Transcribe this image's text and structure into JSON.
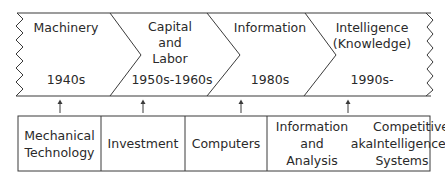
{
  "eras": [
    {
      "name": "Machinery",
      "period": "1940s"
    },
    {
      "name_lines": [
        "Capital",
        "and",
        "Labor"
      ],
      "period": "1950s-1960s"
    },
    {
      "name": "Information",
      "period": "1980s"
    },
    {
      "name_lines": [
        "Intelligence",
        "(Knowledge)"
      ],
      "period": "1990s-"
    }
  ],
  "drivers": [
    {
      "lines": [
        "Mechanical",
        "Technology"
      ]
    },
    {
      "lines": [
        "Investment"
      ]
    },
    {
      "lines": [
        "Computers"
      ]
    },
    {
      "left_lines": [
        "Information",
        "and",
        "Analysis"
      ],
      "connector": "aka",
      "right_lines": [
        "Competitive",
        "Intelligence",
        "Systems"
      ]
    }
  ],
  "colors": {
    "line": "#3a3a3a",
    "text": "#2a2a2a",
    "background": "#ffffff"
  }
}
